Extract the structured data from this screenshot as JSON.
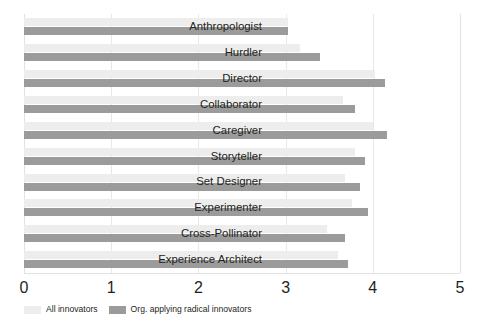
{
  "chart_data": {
    "type": "bar",
    "orientation": "horizontal",
    "title": "",
    "subtitle": "",
    "xlabel": "",
    "ylabel": "",
    "xlim": [
      0,
      5
    ],
    "xticks": [
      "0",
      "1",
      "2",
      "3",
      "4",
      "5"
    ],
    "grid": true,
    "legend_position": "bottom-left",
    "categories": [
      "Anthropologist",
      "Hurdler",
      "Director",
      "Collaborator",
      "Caregiver",
      "Storyteller",
      "Set Designer",
      "Experimenter",
      "Cross-Pollinator",
      "Experience Architect"
    ],
    "series": [
      {
        "name": "All innovators",
        "color": "#ededed",
        "values": [
          3.03,
          3.17,
          4.03,
          3.66,
          4.0,
          3.8,
          3.68,
          3.76,
          3.47,
          3.6
        ]
      },
      {
        "name": "Org. applying radical innovators",
        "color": "#9b9b9b",
        "values": [
          3.03,
          3.4,
          4.14,
          3.8,
          4.16,
          3.91,
          3.85,
          3.95,
          3.68,
          3.72
        ]
      }
    ]
  },
  "colors": {
    "series_light": "#ededed",
    "series_dark": "#9b9b9b",
    "gridline": "#e8e8e8",
    "text": "#231f20",
    "background": "#ffffff"
  }
}
